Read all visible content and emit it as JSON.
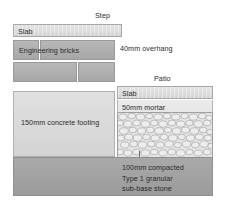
{
  "diagram": {
    "title_step": "Step",
    "title_patio": "Patio",
    "annotations": {
      "overhang": "40mm overhang"
    },
    "step_layers": [
      {
        "key": "slab",
        "label": "Slab",
        "color": "#dcdcdc"
      },
      {
        "key": "bricks",
        "label": "Engineering bricks",
        "color": "#aeaeae"
      },
      {
        "key": "footing",
        "label": "150mm concrete footing",
        "color": "#dadada"
      }
    ],
    "patio_layers": [
      {
        "key": "slab",
        "label": "Slab",
        "color": "#dcdcdc"
      },
      {
        "key": "mortar",
        "label": "50mm mortar",
        "color": "#e8e8e8"
      },
      {
        "key": "aggregate",
        "label": "",
        "color": "#dfdfdf"
      }
    ],
    "base_layer": {
      "key": "subbase",
      "label_line1": "100mm compacted",
      "label_line2": "Type 1 granular",
      "label_line3": "sub-base stone",
      "color": "#a2a2a2"
    },
    "palette": {
      "background": "#ffffff",
      "text": "#2b2b2b",
      "slab": "#dcdcdc",
      "brick": "#aeaeae",
      "concrete": "#dadada",
      "mortar": "#e8e8e8",
      "aggregate": "#dfdfdf",
      "subbase": "#a2a2a2",
      "outline": "#9a9a9a"
    }
  }
}
